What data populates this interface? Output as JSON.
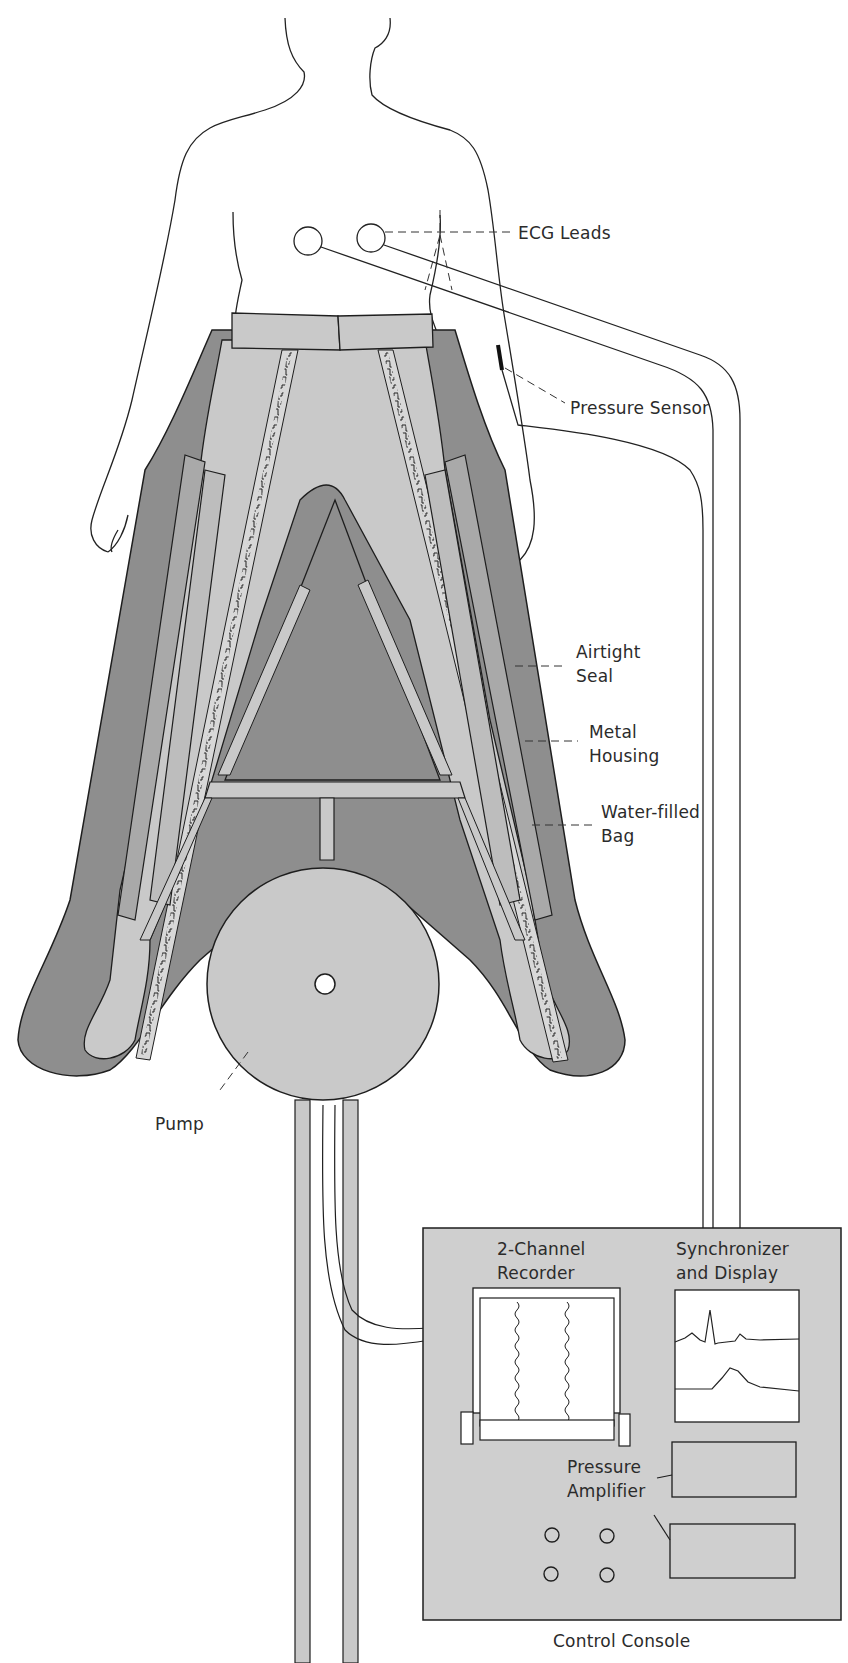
{
  "diagram": {
    "type": "medical-apparatus-schematic",
    "colors": {
      "background": "#ffffff",
      "outline": "#1e1e1e",
      "suit_light": "#c8c8c8",
      "suit_dark": "#8e8e8e",
      "console_fill": "#cfcfcf",
      "display_fill": "#ffffff"
    },
    "labels": {
      "ecg_leads": "ECG Leads",
      "pressure_sensor": "Pressure Sensor",
      "airtight_seal": [
        "Airtight",
        "Seal"
      ],
      "metal_housing": [
        "Metal",
        "Housing"
      ],
      "water_filled_bag": [
        "Water-filled",
        "Bag"
      ],
      "pump": "Pump",
      "recorder": [
        "2-Channel",
        "Recorder"
      ],
      "synchronizer": [
        "Synchronizer",
        "and Display"
      ],
      "pressure_amplifier": [
        "Pressure",
        "Amplifier"
      ],
      "control_console": "Control Console"
    },
    "components": [
      "Human figure (torso and arms)",
      "ECG Leads (2 electrodes)",
      "Pressure Sensor",
      "Lower-body suit with zippers",
      "Airtight Seal",
      "Metal Housing",
      "Water-filled Bag",
      "Pump",
      "Control Console",
      "2-Channel Recorder",
      "Synchronizer and Display",
      "Pressure Amplifier (2 units)",
      "Control knobs (4)"
    ]
  }
}
